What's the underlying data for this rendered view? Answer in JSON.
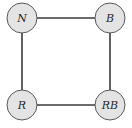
{
  "diagram": {
    "type": "graph",
    "nodes": [
      {
        "id": "N",
        "label": "N",
        "cx": 22,
        "cy": 18
      },
      {
        "id": "B",
        "label": "B",
        "cx": 110,
        "cy": 18
      },
      {
        "id": "R",
        "label": "R",
        "cx": 22,
        "cy": 105
      },
      {
        "id": "RB",
        "label": "RB",
        "cx": 110,
        "cy": 105
      }
    ],
    "edges": [
      {
        "from": "N",
        "to": "B"
      },
      {
        "from": "N",
        "to": "R"
      },
      {
        "from": "B",
        "to": "RB"
      },
      {
        "from": "R",
        "to": "RB"
      }
    ],
    "node_radius": 15,
    "colors": {
      "node_fill": "#e4e4e4",
      "node_stroke": "#5a5a5a",
      "edge": "#3a3a3a",
      "label": "#2a2a2a"
    }
  }
}
